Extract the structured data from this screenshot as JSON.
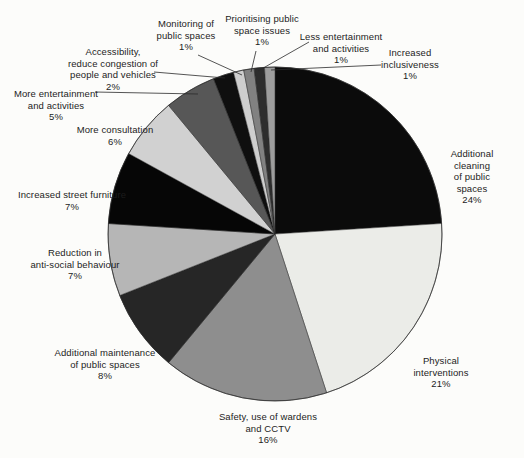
{
  "figure": {
    "background_color": "#fcfcfa",
    "text_color": "#1c1c1c",
    "line_color": "#2a2a2a"
  },
  "chart_data": {
    "type": "pie",
    "title": "",
    "unit": "%",
    "legend": "none",
    "direction": "clockwise",
    "start_angle_deg": 0,
    "total": 100,
    "center": {
      "x": 275,
      "y": 234
    },
    "radius": 167,
    "categories": [
      "Additional cleaning of public spaces",
      "Physical interventions",
      "Safety, use of wardens and CCTV",
      "Additional maintenance of public spaces",
      "Reduction in anti-social behaviour",
      "Increased street furniture",
      "More consultation",
      "More entertainment and activities",
      "Accessibility, reduce congestion of people and vehicles",
      "Monitoring of public spaces",
      "Prioritising public space issues",
      "Less entertainment and activities",
      "Increased inclusiveness"
    ],
    "values": [
      24,
      21,
      16,
      8,
      7,
      7,
      6,
      5,
      2,
      1,
      1,
      1,
      1
    ],
    "slices": [
      {
        "id": "additional-cleaning",
        "label": "Additional cleaning\nof public spaces",
        "pct_label": "24%",
        "value": 24,
        "color": "#0b0b0b",
        "label_x": 472,
        "label_y": 148,
        "leader": null
      },
      {
        "id": "physical-interventions",
        "label": "Physical interventions",
        "pct_label": "21%",
        "value": 21,
        "color": "#ebece8",
        "label_x": 441,
        "label_y": 355,
        "leader": null
      },
      {
        "id": "safety-wardens-cctv",
        "label": "Safety, use of wardens\nand CCTV",
        "pct_label": "16%",
        "value": 16,
        "color": "#8e8e8e",
        "label_x": 268,
        "label_y": 411,
        "leader": null
      },
      {
        "id": "additional-maintenance",
        "label": "Additional maintenance\nof public spaces",
        "pct_label": "8%",
        "value": 8,
        "color": "#262626",
        "label_x": 105,
        "label_y": 347,
        "leader": null
      },
      {
        "id": "reduction-antisocial",
        "label": "Reduction in\nanti-social behaviour",
        "pct_label": "7%",
        "value": 7,
        "color": "#b6b6b6",
        "label_x": 75,
        "label_y": 247,
        "leader": null
      },
      {
        "id": "street-furniture",
        "label": "Increased street furniture",
        "pct_label": "7%",
        "value": 7,
        "color": "#060606",
        "label_x": 72,
        "label_y": 189,
        "leader": null
      },
      {
        "id": "more-consultation",
        "label": "More consultation",
        "pct_label": "6%",
        "value": 6,
        "color": "#d1d1d1",
        "label_x": 115,
        "label_y": 124,
        "leader": null
      },
      {
        "id": "more-entertainment",
        "label": "More entertainment\nand activities",
        "pct_label": "5%",
        "value": 5,
        "color": "#575757",
        "label_x": 56,
        "label_y": 88,
        "leader": {
          "x1": 95,
          "y1": 92,
          "x2": 198,
          "y2": 94
        }
      },
      {
        "id": "accessibility",
        "label": "Accessibility,\nreduce congestion of\npeople and vehicles",
        "pct_label": "2%",
        "value": 2,
        "color": "#0f0f0f",
        "label_x": 113,
        "label_y": 46,
        "leader": {
          "x1": 154,
          "y1": 72,
          "x2": 225,
          "y2": 78
        }
      },
      {
        "id": "monitoring",
        "label": "Monitoring of\npublic spaces",
        "pct_label": "1%",
        "value": 1,
        "color": "#cecece",
        "label_x": 186,
        "label_y": 18,
        "leader": {
          "x1": 198,
          "y1": 55,
          "x2": 242,
          "y2": 75
        }
      },
      {
        "id": "prioritising",
        "label": "Prioritising public\nspace issues",
        "pct_label": "1%",
        "value": 1,
        "color": "#818181",
        "label_x": 262,
        "label_y": 13,
        "leader": {
          "x1": 256,
          "y1": 51,
          "x2": 251,
          "y2": 72
        }
      },
      {
        "id": "less-entertainment",
        "label": "Less entertainment\nand activities",
        "pct_label": "1%",
        "value": 1,
        "color": "#2d2d2d",
        "label_x": 341,
        "label_y": 31,
        "leader": {
          "x1": 309,
          "y1": 42,
          "x2": 258,
          "y2": 71
        }
      },
      {
        "id": "increased-inclusiveness",
        "label": "Increased\ninclusiveness",
        "pct_label": "1%",
        "value": 1,
        "color": "#9d9d9d",
        "label_x": 410,
        "label_y": 47,
        "leader": {
          "x1": 381,
          "y1": 65,
          "x2": 271,
          "y2": 70
        }
      }
    ]
  }
}
